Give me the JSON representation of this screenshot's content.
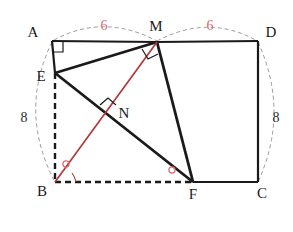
{
  "figure": {
    "background_color": "#ffffff",
    "stroke_color": "#1a1a1a",
    "accent_color": "#b03a3a",
    "dashed_arc_color": "#8a8a8a",
    "measure_color": "#d96a72"
  },
  "points": [
    {
      "name": "A",
      "label": "A",
      "x": 52,
      "y": 41,
      "label_x": 38,
      "label_y": 35
    },
    {
      "name": "M",
      "label": "M",
      "x": 157,
      "y": 42,
      "label_x": 150,
      "label_y": 29
    },
    {
      "name": "D",
      "label": "D",
      "x": 258,
      "y": 41,
      "label_x": 264,
      "label_y": 35
    },
    {
      "name": "E",
      "label": "E",
      "x": 55,
      "y": 73,
      "label_x": 36,
      "label_y": 81
    },
    {
      "name": "N",
      "label": "N",
      "x": 112,
      "y": 112,
      "label_x": 119,
      "label_y": 118
    },
    {
      "name": "B",
      "label": "B",
      "x": 55,
      "y": 182,
      "label_x": 38,
      "label_y": 195
    },
    {
      "name": "F",
      "label": "F",
      "x": 193,
      "y": 182,
      "label_x": 188,
      "label_y": 199
    },
    {
      "name": "C",
      "label": "C",
      "x": 258,
      "y": 182,
      "label_x": 263,
      "label_y": 197
    }
  ],
  "segments": [
    {
      "name": "A-M",
      "style": "solid",
      "color": "#1a1a1a",
      "width": 2.2
    },
    {
      "name": "M-D",
      "style": "solid",
      "color": "#1a1a1a",
      "width": 2.2
    },
    {
      "name": "D-C",
      "style": "solid",
      "color": "#1a1a1a",
      "width": 2.2
    },
    {
      "name": "F-C",
      "style": "solid",
      "color": "#1a1a1a",
      "width": 2.2
    },
    {
      "name": "A-E",
      "style": "solid",
      "color": "#1a1a1a",
      "width": 2.2
    },
    {
      "name": "E-M",
      "style": "solid",
      "color": "#1a1a1a",
      "width": 2.6
    },
    {
      "name": "E-F",
      "style": "solid",
      "color": "#1a1a1a",
      "width": 2.6
    },
    {
      "name": "M-F",
      "style": "solid",
      "color": "#1a1a1a",
      "width": 2.6
    },
    {
      "name": "E-B",
      "style": "dashed",
      "color": "#1a1a1a",
      "width": 2.4
    },
    {
      "name": "B-F",
      "style": "dashed",
      "color": "#1a1a1a",
      "width": 2.4
    },
    {
      "name": "B-M",
      "style": "solid",
      "color": "#b03a3a",
      "width": 1.6
    }
  ],
  "arcs": [
    {
      "name": "arc-A-M",
      "measure": "6",
      "measure_x": 101,
      "measure_y": 28,
      "color": "#8a8a8a"
    },
    {
      "name": "arc-M-D",
      "measure": "6",
      "measure_x": 207,
      "measure_y": 28,
      "color": "#8a8a8a"
    },
    {
      "name": "arc-A-B",
      "measure": "8",
      "measure_x": 22,
      "measure_y": 118,
      "color": "#8a8a8a"
    },
    {
      "name": "arc-D-C",
      "measure": "8",
      "measure_x": 272,
      "measure_y": 118,
      "color": "#8a8a8a"
    }
  ],
  "angle_marks": [
    {
      "name": "right-angle-A",
      "type": "right-angle",
      "at": "A",
      "color": "#1a1a1a"
    },
    {
      "name": "right-angle-M",
      "type": "right-angle",
      "at": "M",
      "color": "#1a1a1a"
    },
    {
      "name": "right-angle-N",
      "type": "right-angle",
      "at": "N",
      "color": "#1a1a1a"
    },
    {
      "name": "angle-arc-B",
      "type": "arc",
      "at": "B",
      "color": "#b03a3a"
    },
    {
      "name": "angle-mark-B",
      "type": "circle",
      "at": "B",
      "color": "#d96a72"
    },
    {
      "name": "angle-mark-F",
      "type": "circle",
      "at": "F",
      "color": "#d96a72"
    }
  ],
  "labels": {
    "A": "A",
    "B": "B",
    "C": "C",
    "D": "D",
    "E": "E",
    "F": "F",
    "M": "M",
    "N": "N",
    "len_am": "6",
    "len_md": "6",
    "len_ab": "8",
    "len_dc": "8"
  }
}
